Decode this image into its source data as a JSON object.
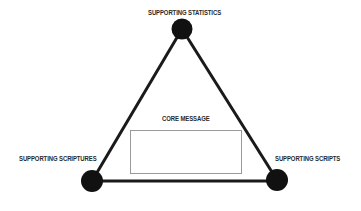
{
  "diagram": {
    "type": "triangle",
    "nodes": [
      {
        "id": "top",
        "label": "SUPPORTING STATISTICS"
      },
      {
        "id": "bottom-left",
        "label": "SUPPORTING SCRIPTURES"
      },
      {
        "id": "bottom-right",
        "label": "SUPPORTING SCRIPTS"
      }
    ],
    "center": {
      "label": "CORE MESSAGE"
    },
    "colors": {
      "stroke": "#1a1a1a",
      "node_fill": "#111111",
      "box_border": "#9a9a9a",
      "text": "#2a2a2a"
    }
  }
}
